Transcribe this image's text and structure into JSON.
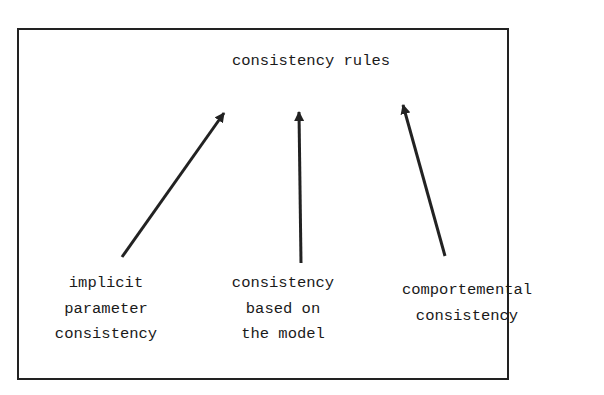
{
  "diagram": {
    "title": "consistency rules",
    "nodes": [
      {
        "id": "implicit",
        "lines": [
          "implicit",
          "parameter",
          "consistency"
        ]
      },
      {
        "id": "model",
        "lines": [
          "consistency",
          "based on",
          "the model"
        ]
      },
      {
        "id": "comportemental",
        "lines": [
          "comportemental",
          "consistency"
        ]
      }
    ],
    "edges": [
      {
        "from": "implicit",
        "to": "title"
      },
      {
        "from": "model",
        "to": "title"
      },
      {
        "from": "comportemental",
        "to": "title"
      }
    ],
    "colors": {
      "stroke": "#222222",
      "background": "#ffffff"
    }
  }
}
